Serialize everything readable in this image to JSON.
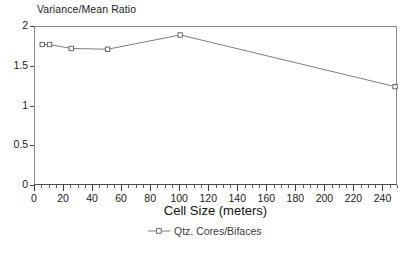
{
  "chart_data": {
    "type": "line",
    "title": "Variance/Mean Ratio",
    "subtitle": "",
    "xlabel": "Cell Size (meters)",
    "ylabel": "",
    "xlim": [
      0,
      250
    ],
    "ylim": [
      0,
      2
    ],
    "grid": false,
    "legend_position": "bottom-center",
    "x_major_step": 20,
    "x_minor_step": 5,
    "y_major_step": 0.5,
    "x_tick_labels": [
      "0",
      "20",
      "40",
      "60",
      "80",
      "100",
      "120",
      "140",
      "160",
      "180",
      "200",
      "220",
      "240"
    ],
    "y_tick_labels": [
      "0",
      "0.5",
      "1",
      "1.5",
      "2"
    ],
    "series": [
      {
        "name": "Qtz. Cores/Bifaces",
        "marker": "open-square",
        "color": "#6e6e6e",
        "x": [
          5,
          10,
          25,
          50,
          100,
          248
        ],
        "values": [
          1.78,
          1.78,
          1.73,
          1.72,
          1.9,
          1.25
        ]
      }
    ],
    "annotations": []
  },
  "legend": {
    "entries": [
      {
        "label": "Qtz. Cores/Bifaces",
        "marker": "open-square-with-line"
      }
    ]
  },
  "colors": {
    "line": "#6e6e6e",
    "marker_stroke": "#5a5a5a",
    "marker_fill": "#ffffff",
    "axis": "#4a4a4a",
    "frame": "#8a8a8a",
    "text": "#1a1a1a",
    "background": "#ffffff"
  }
}
